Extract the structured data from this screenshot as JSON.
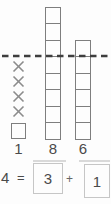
{
  "chart_data": {
    "type": "bar",
    "subtype": "unit-square-stacks",
    "categories": [
      "1",
      "8",
      "6"
    ],
    "values": [
      1,
      8,
      6
    ],
    "crossed_out_units": [
      4,
      0,
      0
    ],
    "reference_line": {
      "style": "dashed",
      "height_units": 5
    },
    "ylim": [
      0,
      8
    ],
    "title": "",
    "xlabel": "",
    "ylabel": "",
    "grid": false,
    "legend": false
  },
  "diagram": {
    "columns": [
      {
        "label": "1",
        "squares": 1,
        "x_marks": 4
      },
      {
        "label": "8",
        "squares": 8,
        "x_marks": 0
      },
      {
        "label": "6",
        "squares": 6,
        "x_marks": 0
      }
    ],
    "colors": {
      "square_border": "#7e7e7e",
      "x_mark": "#8c8c8c",
      "dashed_line": "#3e3e3e",
      "label_text": "#4a4a4a",
      "answer_box_border": "#c6c6c6",
      "background": "#fdfdfd"
    }
  },
  "equation": {
    "lhs": "4",
    "equals_sign": "=",
    "addend1": "3",
    "plus_sign": "+",
    "addend2": "1"
  }
}
